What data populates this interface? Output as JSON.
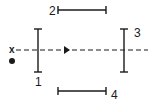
{
  "diagram": {
    "type": "optical-mirror-arrangement",
    "colors": {
      "ink": "#1a1a1a",
      "background": "#ffffff"
    },
    "source": {
      "label": "x",
      "marker": "filled-dot"
    },
    "beam": {
      "style": "dashed",
      "direction": "right"
    },
    "elements": [
      {
        "id": "1",
        "label": "1",
        "orientation": "vertical"
      },
      {
        "id": "2",
        "label": "2",
        "orientation": "horizontal"
      },
      {
        "id": "3",
        "label": "3",
        "orientation": "vertical"
      },
      {
        "id": "4",
        "label": "4",
        "orientation": "horizontal"
      }
    ]
  }
}
